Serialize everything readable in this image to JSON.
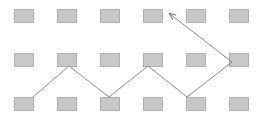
{
  "diagram": {
    "grid": {
      "rows": 3,
      "cols": 6
    },
    "node_color": "#c8c8c8",
    "node_border": "#b0b0b0",
    "line_color": "#8a8a8a",
    "nodes": [
      {
        "x": 14,
        "y": 9
      },
      {
        "x": 57,
        "y": 9
      },
      {
        "x": 100,
        "y": 9
      },
      {
        "x": 143,
        "y": 9
      },
      {
        "x": 186,
        "y": 9
      },
      {
        "x": 229,
        "y": 9
      },
      {
        "x": 14,
        "y": 53
      },
      {
        "x": 57,
        "y": 53
      },
      {
        "x": 100,
        "y": 53
      },
      {
        "x": 143,
        "y": 53
      },
      {
        "x": 186,
        "y": 53
      },
      {
        "x": 229,
        "y": 53
      },
      {
        "x": 14,
        "y": 97
      },
      {
        "x": 57,
        "y": 97
      },
      {
        "x": 100,
        "y": 97
      },
      {
        "x": 143,
        "y": 97
      },
      {
        "x": 186,
        "y": 97
      },
      {
        "x": 229,
        "y": 97
      }
    ],
    "path_points": "33,97 69,66 109,97 148,66 187,97 232,62 170,14"
  }
}
